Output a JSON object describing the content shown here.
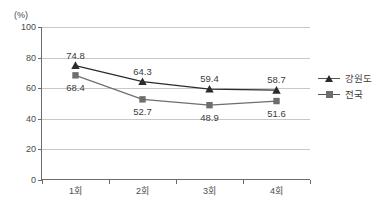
{
  "chart_data": {
    "type": "line",
    "title": "",
    "subtitle": "",
    "unit_label": "(%)",
    "xlabel": "",
    "ylabel": "",
    "categories": [
      "1회",
      "2회",
      "3회",
      "4회"
    ],
    "ylim": [
      0,
      100
    ],
    "ytick_values": [
      0,
      20,
      40,
      60,
      80,
      100
    ],
    "ytick_labels": [
      "0",
      "20",
      "40",
      "60",
      "80",
      "100"
    ],
    "grid": true,
    "grid_axis": "y",
    "legend_position": "right",
    "series": [
      {
        "name": "강원도",
        "marker": "triangle",
        "color": "#2b2b2b",
        "values": [
          74.8,
          64.3,
          59.4,
          58.7
        ],
        "value_labels": [
          "74.8",
          "64.3",
          "59.4",
          "58.7"
        ]
      },
      {
        "name": "전국",
        "marker": "square",
        "color": "#6e6e6e",
        "values": [
          68.4,
          52.7,
          48.9,
          51.6
        ],
        "value_labels": [
          "68.4",
          "52.7",
          "48.9",
          "51.6"
        ]
      }
    ]
  },
  "colors": {
    "axis": "#6b6b6b",
    "grid": "#c8c8c8",
    "text": "#3c3c3c",
    "series_gangwon": "#2b2b2b",
    "series_national": "#6e6e6e",
    "background": "#ffffff"
  },
  "legend": {
    "items": [
      {
        "label": "강원도",
        "marker": "triangle-marker"
      },
      {
        "label": "전국",
        "marker": "square-marker"
      }
    ]
  }
}
